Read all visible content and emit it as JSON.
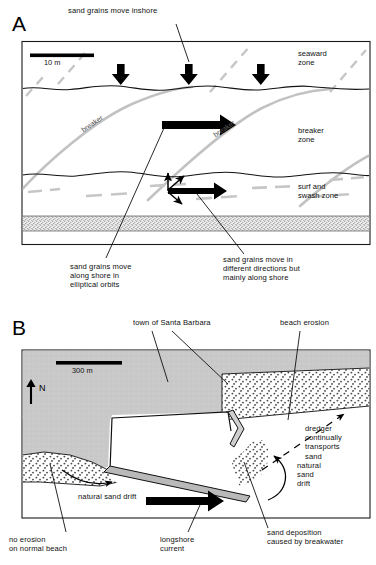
{
  "figure": {
    "panels": [
      {
        "letter": "A",
        "scale_bar_label": "10 m",
        "zone_labels": [
          "seaward\nzone",
          "breaker\nzone",
          "surf and\nswash zone"
        ],
        "curve_labels": [
          "breaker",
          "breaker"
        ],
        "annotations": [
          "sand grains move inshore",
          "sand grains move in\ndifferent directions but\nmainly along shore",
          "sand grains move\nalong shore in\nelliptical orbits"
        ]
      },
      {
        "letter": "B",
        "scale_bar_label": "300 m",
        "north_label": "N",
        "annotations": [
          "town of Santa Barbara",
          "beach erosion",
          "dredger\ncontinually\ntransports\nsand",
          "natural\nsand\ndrift",
          "natural sand drift",
          "sand deposition\ncaused by breakwater",
          "no erosion\non normal beach",
          "longshore\ncurrent"
        ]
      }
    ]
  },
  "colors": {
    "ink": "#000000",
    "land_gray": "#c9c9c9",
    "wave_gray": "#bdbdbd",
    "sand_stipple": "#6e6e6e",
    "border": "#1a1a1a"
  }
}
